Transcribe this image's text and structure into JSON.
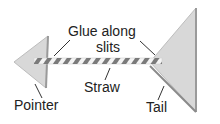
{
  "labels": {
    "glue_line1": "Glue along",
    "glue_line2": "slits",
    "straw": "Straw",
    "pointer": "Pointer",
    "tail": "Tail"
  },
  "colors": {
    "card": "#d9d9d9",
    "card_edge": "#9a9a9a",
    "stripe": "#777777"
  }
}
